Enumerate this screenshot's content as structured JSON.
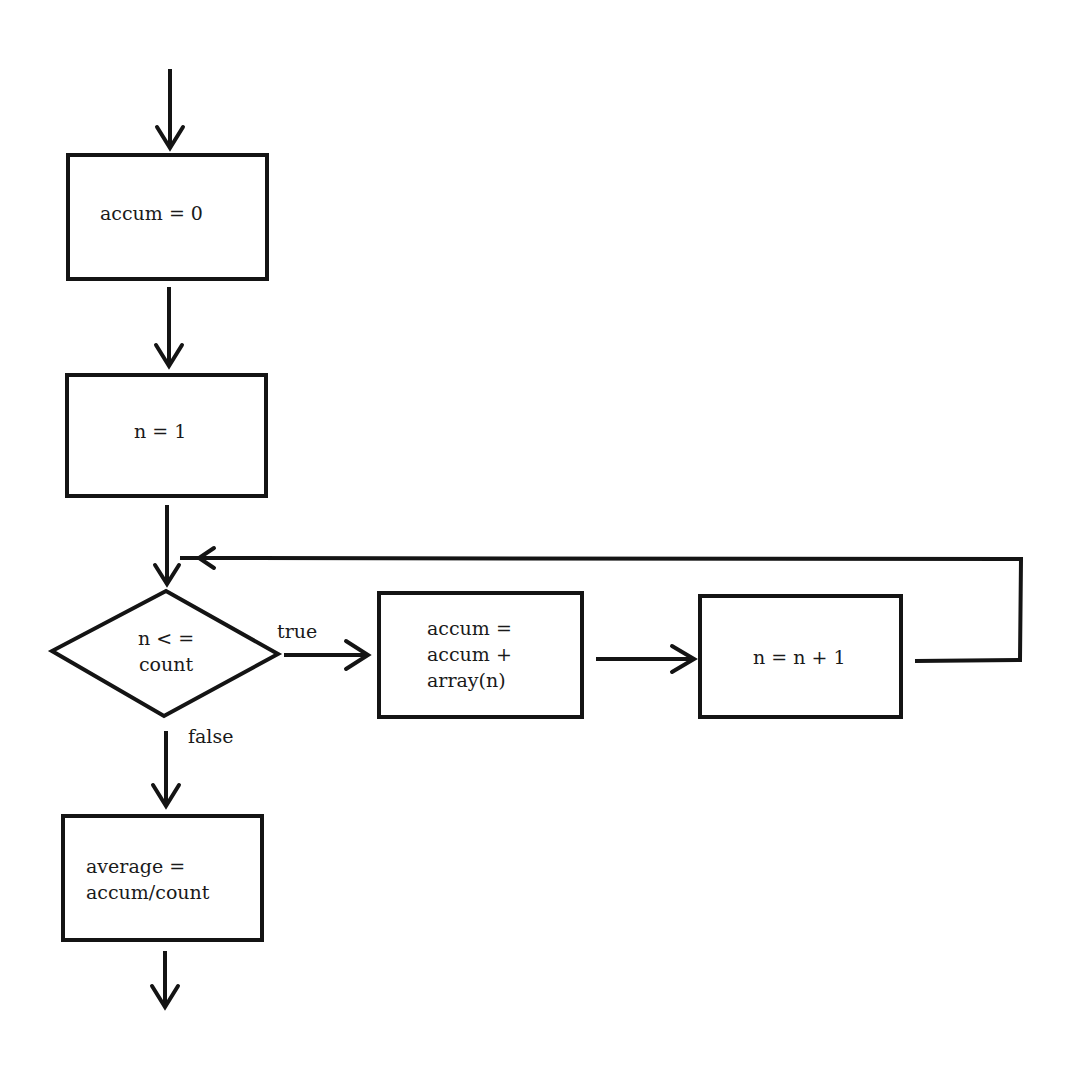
{
  "flowchart": {
    "nodes": [
      {
        "id": "init-accum",
        "type": "process",
        "text": "accum = 0"
      },
      {
        "id": "init-n",
        "type": "process",
        "text": "n = 1"
      },
      {
        "id": "loop-check",
        "type": "decision",
        "text_line1": "n < =",
        "text_line2": "count"
      },
      {
        "id": "accumulate",
        "type": "process",
        "text_line1": "accum =",
        "text_line2": "accum +",
        "text_line3": "array(n)"
      },
      {
        "id": "increment",
        "type": "process",
        "text": "n = n + 1"
      },
      {
        "id": "compute-average",
        "type": "process",
        "text_line1": "average =",
        "text_line2": "accum/count"
      }
    ],
    "edge_labels": {
      "true": "true",
      "false": "false"
    }
  }
}
